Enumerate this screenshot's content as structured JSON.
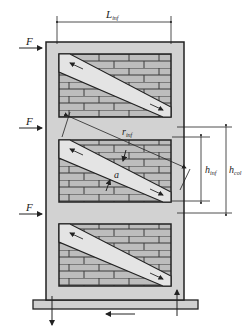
{
  "diagram": {
    "type": "infilled-frame-equivalent-strut",
    "colors": {
      "frame": "#d2d2d2",
      "brick": "#bdbdbd",
      "mortar": "#3a3a3a",
      "strut": "#e4e4e4",
      "line": "#222222",
      "base": "#d0d0d0"
    },
    "labels": {
      "L_inf": {
        "main": "L",
        "sub": "inf"
      },
      "h_inf": {
        "main": "h",
        "sub": "inf"
      },
      "h_col": {
        "main": "h",
        "sub": "col"
      },
      "r_inf": {
        "main": "r",
        "sub": "inf"
      },
      "a": "a",
      "force": "F"
    },
    "forces": [
      {
        "label": "F",
        "story": 1,
        "y": 47
      },
      {
        "label": "F",
        "story": 2,
        "y": 130
      },
      {
        "label": "F",
        "story": 3,
        "y": 213
      }
    ],
    "panels": [
      {
        "id": "panel-top",
        "x": 59,
        "y": 54,
        "w": 112,
        "h": 63
      },
      {
        "id": "panel-middle",
        "x": 59,
        "y": 140,
        "w": 112,
        "h": 62
      },
      {
        "id": "panel-bottom",
        "x": 59,
        "y": 224,
        "w": 112,
        "h": 62
      }
    ],
    "reactions": [
      "downward-left",
      "upward-right",
      "horizontal-shear-left"
    ]
  }
}
